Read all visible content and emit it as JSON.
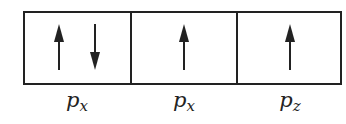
{
  "diagram": {
    "type": "orbital-box-diagram",
    "line_color": "#222222",
    "boxes": [
      {
        "label_main": "p",
        "label_sub": "x",
        "electrons": [
          "up",
          "down"
        ]
      },
      {
        "label_main": "p",
        "label_sub": "x",
        "electrons": [
          "up"
        ]
      },
      {
        "label_main": "p",
        "label_sub": "z",
        "electrons": [
          "up"
        ]
      }
    ]
  }
}
